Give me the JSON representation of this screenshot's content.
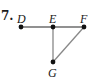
{
  "problem_number": "7.",
  "graph": {
    "vertices": [
      {
        "id": "D",
        "label": "D",
        "x": 21,
        "y": 27
      },
      {
        "id": "E",
        "label": "E",
        "x": 53,
        "y": 27
      },
      {
        "id": "F",
        "label": "F",
        "x": 84,
        "y": 27
      },
      {
        "id": "G",
        "label": "G",
        "x": 53,
        "y": 62
      }
    ],
    "edges": [
      {
        "from": "D",
        "to": "E"
      },
      {
        "from": "E",
        "to": "F"
      },
      {
        "from": "E",
        "to": "G"
      },
      {
        "from": "F",
        "to": "G"
      }
    ],
    "edge_colors": {
      "D-E": "#555555",
      "E-F": "#555555",
      "E-G": "#888888",
      "F-G": "#888888"
    },
    "vertex_color": "#111111"
  }
}
